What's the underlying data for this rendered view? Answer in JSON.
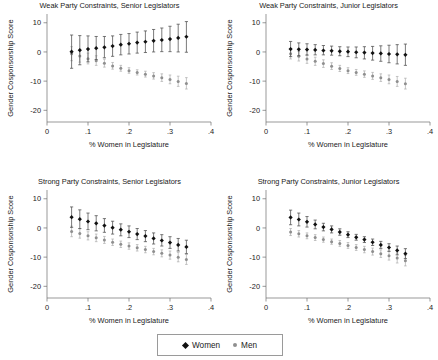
{
  "figure": {
    "width": 438,
    "height": 360,
    "background": "#ffffff"
  },
  "legend": {
    "position": "bottom-center",
    "boxed": true,
    "entries": [
      {
        "label": "Women",
        "marker": "diamond-marker-icon",
        "color": "#111111"
      },
      {
        "label": "Men",
        "marker": "dot-marker-icon",
        "color": "#8f8f8f"
      }
    ]
  },
  "chart_data": [
    {
      "type": "scatter",
      "panel": "top-left",
      "title": "Weak Party Constraints, Senior Legislators",
      "xlabel": "% Women in Legislature",
      "ylabel": "Gender Cosponsorship Score",
      "xlim": [
        0,
        0.4
      ],
      "ylim": [
        -24,
        13
      ],
      "xticks": [
        0,
        0.1,
        0.2,
        0.3,
        0.4
      ],
      "xticklabels": [
        "0",
        ".1",
        ".2",
        ".3",
        ".4"
      ],
      "yticks": [
        10,
        0,
        -10,
        -20
      ],
      "yticklabels": [
        "10",
        "0",
        "-10",
        "-20"
      ],
      "grid": false,
      "x": [
        0.06,
        0.08,
        0.1,
        0.12,
        0.14,
        0.16,
        0.18,
        0.2,
        0.22,
        0.24,
        0.26,
        0.28,
        0.3,
        0.32,
        0.34
      ],
      "series": [
        {
          "name": "Women",
          "values": [
            0.1,
            0.6,
            1.0,
            1.3,
            1.6,
            2.0,
            2.5,
            2.8,
            3.2,
            3.5,
            3.8,
            4.1,
            4.4,
            4.8,
            5.2
          ],
          "ci_low": [
            -5.6,
            -4.4,
            -3.4,
            -2.6,
            -2.0,
            -1.5,
            -1.0,
            -0.7,
            -0.4,
            -0.2,
            0.0,
            0.1,
            0.1,
            0.0,
            -0.1
          ],
          "ci_high": [
            5.8,
            5.6,
            5.5,
            5.3,
            5.3,
            5.5,
            6.0,
            6.3,
            6.8,
            7.2,
            7.7,
            8.2,
            8.8,
            9.5,
            10.4
          ]
        },
        {
          "name": "Men",
          "values": [
            -0.6,
            -1.4,
            -2.3,
            -3.0,
            -3.9,
            -4.8,
            -5.6,
            -6.4,
            -7.0,
            -7.6,
            -8.2,
            -8.8,
            -9.4,
            -10.1,
            -10.8
          ],
          "ci_low": [
            -3.0,
            -3.5,
            -4.1,
            -4.6,
            -5.2,
            -5.9,
            -6.6,
            -7.3,
            -7.9,
            -8.6,
            -9.3,
            -10.1,
            -10.9,
            -11.8,
            -12.7
          ],
          "ci_high": [
            1.8,
            0.8,
            -0.4,
            -1.3,
            -2.5,
            -3.6,
            -4.6,
            -5.4,
            -6.1,
            -6.6,
            -7.1,
            -7.5,
            -7.9,
            -8.3,
            -8.8
          ]
        }
      ]
    },
    {
      "type": "scatter",
      "panel": "top-right",
      "title": "Weak Party Constraints, Junior Legislators",
      "xlabel": "% Women in Legislature",
      "ylabel": "Gender Cosponsorship Score",
      "xlim": [
        0,
        0.4
      ],
      "ylim": [
        -24,
        13
      ],
      "xticks": [
        0,
        0.1,
        0.2,
        0.3,
        0.4
      ],
      "xticklabels": [
        "0",
        ".1",
        ".2",
        ".3",
        ".4"
      ],
      "yticks": [
        10,
        0,
        -10,
        -20
      ],
      "yticklabels": [
        "10",
        "0",
        "-10",
        "-20"
      ],
      "grid": false,
      "x": [
        0.06,
        0.08,
        0.1,
        0.12,
        0.14,
        0.16,
        0.18,
        0.2,
        0.22,
        0.24,
        0.26,
        0.28,
        0.3,
        0.32,
        0.34
      ],
      "series": [
        {
          "name": "Women",
          "values": [
            1.0,
            0.9,
            0.8,
            0.7,
            0.5,
            0.4,
            0.2,
            0.1,
            -0.1,
            -0.2,
            -0.4,
            -0.5,
            -0.7,
            -0.8,
            -1.0
          ],
          "ci_low": [
            -1.6,
            -1.3,
            -1.1,
            -1.0,
            -1.0,
            -1.1,
            -1.3,
            -1.6,
            -2.0,
            -2.4,
            -2.8,
            -3.2,
            -3.7,
            -4.1,
            -4.6
          ],
          "ci_high": [
            3.6,
            3.1,
            2.8,
            2.5,
            2.2,
            2.0,
            1.8,
            1.7,
            1.7,
            1.8,
            1.9,
            2.1,
            2.3,
            2.5,
            2.7
          ]
        },
        {
          "name": "Men",
          "values": [
            -0.6,
            -1.5,
            -2.4,
            -3.2,
            -4.0,
            -4.9,
            -5.7,
            -6.4,
            -7.0,
            -7.6,
            -8.2,
            -8.8,
            -9.4,
            -10.1,
            -10.9
          ],
          "ci_low": [
            -2.4,
            -3.1,
            -3.9,
            -4.6,
            -5.3,
            -6.0,
            -6.7,
            -7.4,
            -8.0,
            -8.7,
            -9.4,
            -10.1,
            -10.9,
            -11.8,
            -12.7
          ],
          "ci_high": [
            1.2,
            0.2,
            -0.9,
            -1.8,
            -2.7,
            -3.7,
            -4.6,
            -5.4,
            -6.0,
            -6.5,
            -7.0,
            -7.5,
            -7.9,
            -8.4,
            -9.0
          ]
        }
      ]
    },
    {
      "type": "scatter",
      "panel": "bottom-left",
      "title": "Strong Party Constraints, Senior Legislators",
      "xlabel": "% Women in Legislature",
      "ylabel": "Gender Cosponsorship Score",
      "xlim": [
        0,
        0.4
      ],
      "ylim": [
        -24,
        13
      ],
      "xticks": [
        0,
        0.1,
        0.2,
        0.3,
        0.4
      ],
      "xticklabels": [
        "0",
        ".1",
        ".2",
        ".3",
        ".4"
      ],
      "yticks": [
        10,
        0,
        -10,
        -20
      ],
      "yticklabels": [
        "10",
        "0",
        "-10",
        "-20"
      ],
      "grid": false,
      "x": [
        0.06,
        0.08,
        0.1,
        0.12,
        0.14,
        0.16,
        0.18,
        0.2,
        0.22,
        0.24,
        0.26,
        0.28,
        0.3,
        0.32,
        0.34
      ],
      "series": [
        {
          "name": "Women",
          "values": [
            3.7,
            3.0,
            2.2,
            1.6,
            0.8,
            0.1,
            -0.6,
            -1.3,
            -2.1,
            -2.8,
            -3.6,
            -4.3,
            -5.0,
            -5.8,
            -6.5
          ],
          "ci_low": [
            0.2,
            -0.2,
            -0.6,
            -1.0,
            -1.5,
            -2.1,
            -2.7,
            -3.3,
            -4.0,
            -4.7,
            -5.5,
            -6.2,
            -7.0,
            -7.9,
            -8.8
          ],
          "ci_high": [
            7.2,
            6.2,
            5.1,
            4.2,
            3.2,
            2.3,
            1.4,
            0.7,
            -0.2,
            -0.9,
            -1.7,
            -2.3,
            -3.0,
            -3.6,
            -4.2
          ]
        },
        {
          "name": "Men",
          "values": [
            -1.2,
            -1.9,
            -2.7,
            -3.4,
            -4.1,
            -4.9,
            -5.6,
            -6.2,
            -6.8,
            -7.4,
            -8.1,
            -8.7,
            -9.3,
            -10.0,
            -10.8
          ],
          "ci_low": [
            -3.0,
            -3.5,
            -4.1,
            -4.7,
            -5.3,
            -6.0,
            -6.7,
            -7.3,
            -7.9,
            -8.5,
            -9.2,
            -9.9,
            -10.7,
            -11.6,
            -12.5
          ],
          "ci_high": [
            0.6,
            -0.3,
            -1.3,
            -2.1,
            -2.9,
            -3.8,
            -4.5,
            -5.1,
            -5.7,
            -6.3,
            -7.0,
            -7.5,
            -7.9,
            -8.4,
            -9.1
          ]
        }
      ]
    },
    {
      "type": "scatter",
      "panel": "bottom-right",
      "title": "Strong Party Constraints, Junior Legislators",
      "xlabel": "% Women in Legislature",
      "ylabel": "Gender Cosponsorship Score",
      "xlim": [
        0,
        0.4
      ],
      "ylim": [
        -24,
        13
      ],
      "xticks": [
        0,
        0.1,
        0.2,
        0.3,
        0.4
      ],
      "xticklabels": [
        "0",
        ".1",
        ".2",
        ".3",
        ".4"
      ],
      "yticks": [
        10,
        0,
        -10,
        -20
      ],
      "yticklabels": [
        "10",
        "0",
        "-10",
        "-20"
      ],
      "grid": false,
      "x": [
        0.06,
        0.08,
        0.1,
        0.12,
        0.14,
        0.16,
        0.18,
        0.2,
        0.22,
        0.24,
        0.26,
        0.28,
        0.3,
        0.32,
        0.34
      ],
      "series": [
        {
          "name": "Women",
          "values": [
            3.6,
            2.9,
            2.1,
            1.2,
            0.3,
            -0.5,
            -1.4,
            -2.3,
            -3.2,
            -4.0,
            -4.9,
            -5.8,
            -6.7,
            -7.7,
            -8.8
          ],
          "ci_low": [
            1.1,
            0.7,
            0.3,
            -0.3,
            -1.0,
            -1.7,
            -2.5,
            -3.3,
            -4.2,
            -5.0,
            -6.0,
            -7.0,
            -8.0,
            -9.2,
            -10.5
          ],
          "ci_high": [
            6.1,
            5.1,
            3.9,
            2.7,
            1.6,
            0.7,
            -0.3,
            -1.3,
            -2.2,
            -3.0,
            -3.8,
            -4.6,
            -5.4,
            -6.2,
            -7.1
          ]
        },
        {
          "name": "Men",
          "values": [
            -1.4,
            -2.0,
            -2.7,
            -3.3,
            -4.0,
            -4.7,
            -5.3,
            -6.0,
            -6.7,
            -7.4,
            -8.1,
            -8.8,
            -9.5,
            -10.3,
            -11.2
          ],
          "ci_low": [
            -2.6,
            -3.1,
            -3.7,
            -4.3,
            -4.9,
            -5.6,
            -6.3,
            -7.0,
            -7.7,
            -8.5,
            -9.3,
            -10.1,
            -11.0,
            -12.0,
            -13.0
          ],
          "ci_high": [
            -0.2,
            -0.9,
            -1.7,
            -2.3,
            -3.1,
            -3.8,
            -4.3,
            -5.0,
            -5.7,
            -6.3,
            -6.9,
            -7.5,
            -8.0,
            -8.6,
            -9.4
          ]
        }
      ]
    }
  ]
}
